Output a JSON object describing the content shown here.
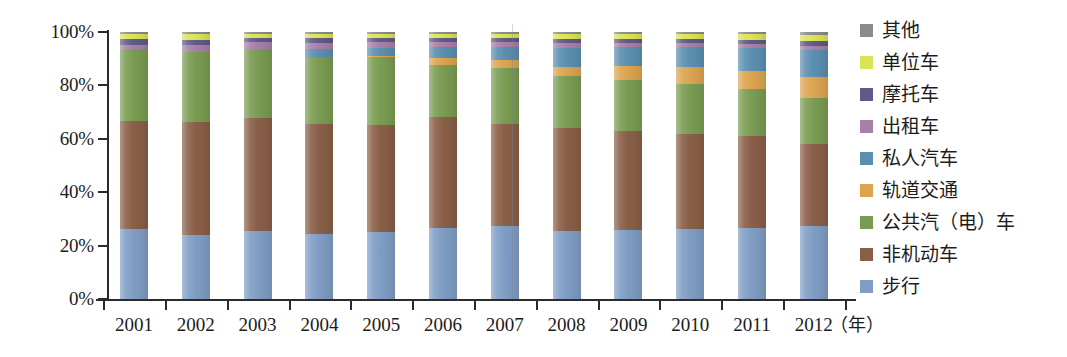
{
  "chart_data": {
    "type": "bar",
    "stacked": true,
    "normalized": true,
    "title": "",
    "xlabel": "年",
    "ylabel": "",
    "ylim": [
      0,
      100
    ],
    "ytick_labels": [
      "0%",
      "20%",
      "40%",
      "60%",
      "80%",
      "100%"
    ],
    "ytick_values": [
      0,
      20,
      40,
      60,
      80,
      100
    ],
    "grid": false,
    "legend_position": "right",
    "categories": [
      "2001",
      "2002",
      "2003",
      "2004",
      "2005",
      "2006",
      "2007",
      "2008",
      "2009",
      "2010",
      "2011",
      "2012"
    ],
    "series": [
      {
        "name": "步行",
        "color": "#7f9dc4",
        "values": [
          26.3,
          23.8,
          25.6,
          24.5,
          25.2,
          26.5,
          27.2,
          25.4,
          25.8,
          26.2,
          26.4,
          27.2
        ]
      },
      {
        "name": "非机动车",
        "color": "#8a5f48",
        "values": [
          40.4,
          42.6,
          42.2,
          41.0,
          40.1,
          41.7,
          38.3,
          38.5,
          37.0,
          35.4,
          34.6,
          30.9
        ]
      },
      {
        "name": "公共汽（电）车",
        "color": "#7a9c52",
        "values": [
          26.8,
          26.0,
          25.7,
          25.3,
          25.2,
          19.3,
          21.1,
          19.5,
          19.3,
          18.8,
          17.6,
          17.1
        ]
      },
      {
        "name": "轨道交通",
        "color": "#dda450",
        "values": [
          0.0,
          0.0,
          0.0,
          0.0,
          0.5,
          2.6,
          3.0,
          3.6,
          5.3,
          6.3,
          6.9,
          8.0
        ]
      },
      {
        "name": "私人汽车",
        "color": "#5b8fb0",
        "values": [
          0.0,
          0.0,
          0.0,
          2.7,
          2.9,
          4.1,
          4.8,
          7.0,
          7.0,
          7.5,
          8.5,
          10.0
        ]
      },
      {
        "name": "出租车",
        "color": "#a87fa8",
        "values": [
          1.8,
          2.7,
          2.6,
          2.4,
          2.3,
          2.1,
          1.9,
          1.8,
          1.6,
          1.6,
          1.5,
          1.5
        ]
      },
      {
        "name": "摩托车",
        "color": "#5f5b86",
        "values": [
          2.0,
          1.8,
          1.8,
          1.8,
          1.6,
          1.5,
          1.5,
          1.5,
          1.4,
          1.4,
          1.6,
          1.9
        ]
      },
      {
        "name": "单位车",
        "color": "#dbe356",
        "values": [
          1.9,
          2.3,
          1.3,
          1.5,
          1.4,
          1.4,
          1.4,
          1.9,
          1.9,
          1.9,
          2.0,
          2.4
        ]
      },
      {
        "name": "其他",
        "color": "#8b8b8b",
        "values": [
          0.8,
          0.8,
          0.8,
          0.8,
          0.8,
          0.8,
          0.8,
          0.8,
          0.7,
          0.9,
          0.9,
          1.0
        ]
      }
    ]
  },
  "legend": {
    "items": [
      {
        "label": "其他",
        "color": "#8b8b8b"
      },
      {
        "label": "单位车",
        "color": "#dbe356"
      },
      {
        "label": "摩托车",
        "color": "#5f5b86"
      },
      {
        "label": "出租车",
        "color": "#a87fa8"
      },
      {
        "label": "私人汽车",
        "color": "#5b8fb0"
      },
      {
        "label": "轨道交通",
        "color": "#dda450"
      },
      {
        "label": "公共汽（电）车",
        "color": "#7a9c52"
      },
      {
        "label": "非机动车",
        "color": "#8a5f48"
      },
      {
        "label": "步行",
        "color": "#7f9dc4"
      }
    ]
  },
  "axes": {
    "x_unit": "（年）"
  }
}
